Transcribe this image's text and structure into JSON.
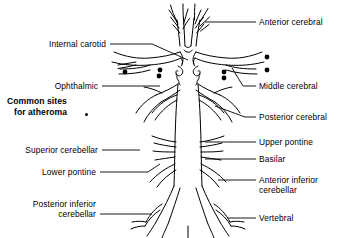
{
  "figure": {
    "background_color": "#ffffff",
    "line_color": "#000000",
    "text_color": "#000000"
  },
  "key": {
    "line1": "Common sites",
    "line2": "for atheroma",
    "marker_name": "atheroma-dot"
  },
  "labels_right": [
    {
      "id": "anterior-cerebral",
      "text": "Anterior cerebral"
    },
    {
      "id": "middle-cerebral",
      "text": "Middle cerebral"
    },
    {
      "id": "posterior-cerebral",
      "text": "Posterior cerebral"
    },
    {
      "id": "upper-pontine",
      "text": "Upper pontine"
    },
    {
      "id": "basilar",
      "text": "Basilar"
    },
    {
      "id": "anterior-inferior-cerebellar-1",
      "text": "Anterior inferior"
    },
    {
      "id": "anterior-inferior-cerebellar-2",
      "text": "cerebellar"
    },
    {
      "id": "vertebral",
      "text": "Vertebral"
    }
  ],
  "labels_left": [
    {
      "id": "internal-carotid",
      "text": "Internal carotid"
    },
    {
      "id": "ophthalmic",
      "text": "Ophthalmic"
    },
    {
      "id": "superior-cerebellar",
      "text": "Superior cerebellar"
    },
    {
      "id": "lower-pontine",
      "text": "Lower pontine"
    },
    {
      "id": "posterior-inferior-cerebellar-1",
      "text": "Posterior inferior"
    },
    {
      "id": "posterior-inferior-cerebellar-2",
      "text": "cerebellar"
    }
  ]
}
